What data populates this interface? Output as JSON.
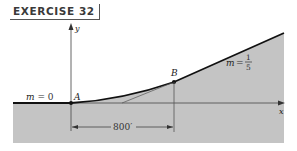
{
  "title": "EXERCISE 32",
  "labels": {
    "y_axis": "y",
    "x_axis": "x",
    "point_a": "A",
    "point_b": "B",
    "slope_left_var": "m",
    "slope_left_eq": "= 0",
    "slope_right_var": "m",
    "slope_right_eq": "=",
    "slope_right_num": "1",
    "slope_right_den": "5",
    "distance": "800′"
  },
  "colors": {
    "ground": "#c4c4c4",
    "curve": "#111111",
    "axis": "#444444",
    "text": "#222222"
  }
}
